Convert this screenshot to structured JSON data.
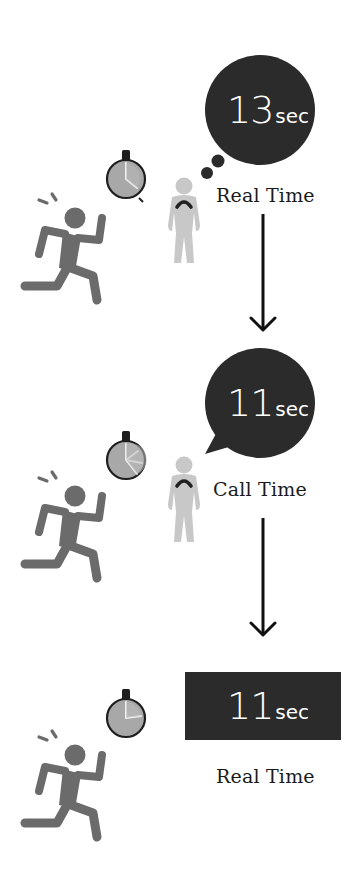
{
  "colors": {
    "background": "#ffffff",
    "bubble_fill": "#2b2b2b",
    "runner_fill": "#6b6b6b",
    "observer_fill": "#c8c8c8",
    "stopwatch_face": "#a8a8a8",
    "stopwatch_rim": "#1e1e1e",
    "arrow": "#111111",
    "text_light": "#ffffff",
    "text_dark": "#1a1a1a"
  },
  "panels": [
    {
      "id": "panel-1",
      "bubble_type": "thought-bubble",
      "time_value": "13",
      "time_unit": "sec",
      "caption": "Real Time",
      "has_observer": true,
      "stopwatch_icon": "stopwatch-icon"
    },
    {
      "id": "panel-2",
      "bubble_type": "speech-bubble",
      "time_value": "11",
      "time_unit": "sec",
      "caption": "Call Time",
      "has_observer": true,
      "stopwatch_icon": "stopwatch-icon"
    },
    {
      "id": "panel-3",
      "bubble_type": "rectangle-display",
      "time_value": "11",
      "time_unit": "sec",
      "caption": "Real Time",
      "has_observer": false,
      "stopwatch_icon": "stopwatch-icon"
    }
  ],
  "arrows": [
    {
      "from": "panel-1",
      "to": "panel-2",
      "icon": "arrow-down-icon"
    },
    {
      "from": "panel-2",
      "to": "panel-3",
      "icon": "arrow-down-icon"
    }
  ]
}
